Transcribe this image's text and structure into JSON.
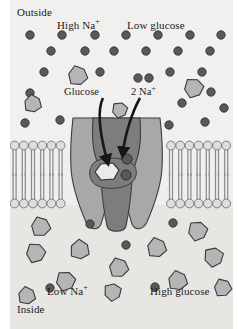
{
  "figure": {
    "labels": {
      "outside": "Outside",
      "inside": "Inside",
      "high_na": "High Na",
      "high_na_charge": "+",
      "low_glucose": "Low glucose",
      "glucose": "Glucose",
      "two_na": "2 Na",
      "two_na_charge": "+",
      "low_na": "Low Na",
      "low_na_charge": "+",
      "high_glucose": "High glucose"
    },
    "colors": {
      "background_outside": "#f2f0ee",
      "background_inside": "#e8e6e3",
      "page_background": "#ffffff",
      "sodium_ion": "#595959",
      "glucose_hexagon_fill": "#b5b5b5",
      "glucose_hexagon_stroke": "#3a3a3a",
      "protein_body": "#a8a8a8",
      "protein_channel": "#7d7d7d",
      "protein_stroke": "#3d3d3d",
      "lipid_head": "#dedede",
      "lipid_head_stroke": "#6e6e6e",
      "lipid_tail": "#8c8c8c",
      "bound_glucose_fill": "#ebebeb",
      "arrow": "#161616",
      "text": "#1b1b1b"
    },
    "geometry": {
      "width": 238,
      "height": 329,
      "content_left": 10,
      "content_right": 233,
      "membrane_top": 140,
      "membrane_bottom": 209,
      "inside_top": 209
    },
    "legend_note": {
      "sodium_symbol": "filled dark circle = Na+ ion",
      "glucose_symbol": "grey hexagon = glucose molecule"
    }
  },
  "sodium_ions_outside": [
    {
      "cx": 30,
      "cy": 35,
      "r": 4.2
    },
    {
      "cx": 62,
      "cy": 35,
      "r": 4.2
    },
    {
      "cx": 95,
      "cy": 35,
      "r": 4.2
    },
    {
      "cx": 126,
      "cy": 35,
      "r": 4.2
    },
    {
      "cx": 158,
      "cy": 35,
      "r": 4.2
    },
    {
      "cx": 190,
      "cy": 35,
      "r": 4.2
    },
    {
      "cx": 221,
      "cy": 35,
      "r": 4.2
    },
    {
      "cx": 51,
      "cy": 51,
      "r": 4.2
    },
    {
      "cx": 85,
      "cy": 51,
      "r": 4.2
    },
    {
      "cx": 114,
      "cy": 51,
      "r": 4.2
    },
    {
      "cx": 146,
      "cy": 51,
      "r": 4.2
    },
    {
      "cx": 178,
      "cy": 51,
      "r": 4.2
    },
    {
      "cx": 210,
      "cy": 51,
      "r": 4.2
    },
    {
      "cx": 44,
      "cy": 72,
      "r": 4.2
    },
    {
      "cx": 100,
      "cy": 72,
      "r": 4.2
    },
    {
      "cx": 170,
      "cy": 72,
      "r": 4.2
    },
    {
      "cx": 202,
      "cy": 72,
      "r": 4.2
    },
    {
      "cx": 30,
      "cy": 93,
      "r": 4.2
    },
    {
      "cx": 138,
      "cy": 78,
      "r": 4.2
    },
    {
      "cx": 149,
      "cy": 78,
      "r": 4.2
    },
    {
      "cx": 211,
      "cy": 92,
      "r": 4.2
    },
    {
      "cx": 182,
      "cy": 103,
      "r": 4.2
    },
    {
      "cx": 25,
      "cy": 123,
      "r": 4.2
    },
    {
      "cx": 60,
      "cy": 120,
      "r": 4.2
    },
    {
      "cx": 169,
      "cy": 125,
      "r": 4.2
    },
    {
      "cx": 205,
      "cy": 122,
      "r": 4.2
    },
    {
      "cx": 224,
      "cy": 108,
      "r": 4.2
    }
  ],
  "glucose_outside": [
    {
      "cx": 78,
      "cy": 76,
      "r": 10,
      "rot": 12
    },
    {
      "cx": 194,
      "cy": 88,
      "r": 10,
      "rot": -8
    },
    {
      "cx": 33,
      "cy": 104,
      "r": 9,
      "rot": 20
    },
    {
      "cx": 120,
      "cy": 110,
      "r": 8,
      "rot": -15
    }
  ],
  "sodium_ions_inside": [
    {
      "cx": 90,
      "cy": 224,
      "r": 4.2
    },
    {
      "cx": 173,
      "cy": 223,
      "r": 4.2
    },
    {
      "cx": 126,
      "cy": 245,
      "r": 4.2
    },
    {
      "cx": 50,
      "cy": 288,
      "r": 4.2
    },
    {
      "cx": 155,
      "cy": 287,
      "r": 4.2
    }
  ],
  "glucose_inside": [
    {
      "cx": 41,
      "cy": 227,
      "r": 10,
      "rot": 8
    },
    {
      "cx": 198,
      "cy": 231,
      "r": 10,
      "rot": -12
    },
    {
      "cx": 36,
      "cy": 253,
      "r": 10,
      "rot": -6
    },
    {
      "cx": 80,
      "cy": 250,
      "r": 10,
      "rot": 25
    },
    {
      "cx": 157,
      "cy": 248,
      "r": 10,
      "rot": 14
    },
    {
      "cx": 214,
      "cy": 257,
      "r": 10,
      "rot": -20
    },
    {
      "cx": 119,
      "cy": 268,
      "r": 10,
      "rot": 10
    },
    {
      "cx": 66,
      "cy": 281,
      "r": 10,
      "rot": -10
    },
    {
      "cx": 178,
      "cy": 281,
      "r": 10,
      "rot": 16
    },
    {
      "cx": 113,
      "cy": 292,
      "r": 9,
      "rot": -22
    },
    {
      "cx": 223,
      "cy": 288,
      "r": 9,
      "rot": 6
    },
    {
      "cx": 27,
      "cy": 296,
      "r": 9,
      "rot": 18
    }
  ],
  "bound_molecules": {
    "glucose": {
      "cx": 107,
      "cy": 172,
      "r": 12
    },
    "sodium": [
      {
        "cx": 127,
        "cy": 159,
        "r": 5
      },
      {
        "cx": 126,
        "cy": 175,
        "r": 5
      }
    ]
  }
}
